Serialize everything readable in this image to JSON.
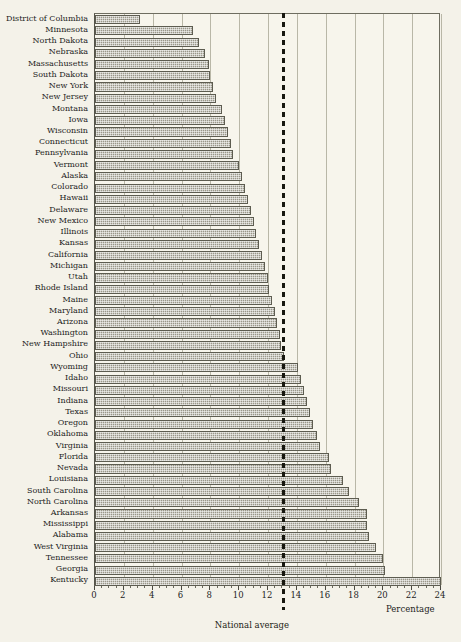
{
  "figure": {
    "clipped_title": "",
    "axis_label_x": "Percentage",
    "national_average_label": "National average",
    "national_average_value": 13.1,
    "accent_color": "#17170f",
    "bar_color": "#9a9789",
    "grid_color": "#b9b7a7",
    "background_color": "#f4f2e9"
  },
  "chart_data": {
    "type": "bar",
    "orientation": "horizontal",
    "title": "",
    "xlabel": "Percentage",
    "ylabel": "",
    "xlim": [
      0,
      24
    ],
    "xticks": [
      0,
      2,
      4,
      6,
      8,
      10,
      12,
      14,
      16,
      18,
      20,
      22,
      24
    ],
    "xtick_labels": [
      "0",
      "2",
      "4",
      "6",
      "8",
      "10",
      "12",
      "14",
      "16",
      "18",
      "20",
      "22",
      "24"
    ],
    "grid": true,
    "legend": "none",
    "annotations": [
      {
        "label": "National average",
        "type": "vline",
        "value": 13.1
      }
    ],
    "categories": [
      "District of Columbia",
      "Minnesota",
      "North Dakota",
      "Nebraska",
      "Massachusetts",
      "South Dakota",
      "New York",
      "New Jersey",
      "Montana",
      "Iowa",
      "Wisconsin",
      "Connecticut",
      "Pennsylvania",
      "Vermont",
      "Alaska",
      "Colorado",
      "Hawaii",
      "Delaware",
      "New Mexico",
      "Illinois",
      "Kansas",
      "California",
      "Michigan",
      "Utah",
      "Rhode Island",
      "Maine",
      "Maryland",
      "Arizona",
      "Washington",
      "New Hampshire",
      "Ohio",
      "Wyoming",
      "Idaho",
      "Missouri",
      "Indiana",
      "Texas",
      "Oregon",
      "Oklahoma",
      "Virginia",
      "Florida",
      "Nevada",
      "Louisiana",
      "South Carolina",
      "North Carolina",
      "Arkansas",
      "Mississippi",
      "Alabama",
      "West Virginia",
      "Tennessee",
      "Georgia",
      "Kentucky"
    ],
    "values": [
      3.1,
      6.8,
      7.2,
      7.6,
      7.9,
      8.0,
      8.2,
      8.4,
      8.8,
      9.0,
      9.2,
      9.4,
      9.6,
      10.0,
      10.2,
      10.4,
      10.6,
      10.8,
      11.0,
      11.2,
      11.4,
      11.6,
      11.8,
      12.0,
      12.1,
      12.3,
      12.5,
      12.6,
      12.8,
      12.9,
      13.1,
      14.1,
      14.3,
      14.5,
      14.7,
      14.9,
      15.1,
      15.4,
      15.6,
      16.2,
      16.4,
      17.2,
      17.6,
      18.3,
      18.9,
      18.9,
      19.0,
      19.5,
      20.0,
      20.1,
      24.0
    ]
  }
}
